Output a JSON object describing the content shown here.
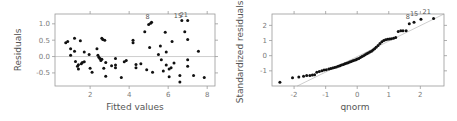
{
  "chart_data": [
    {
      "type": "scatter",
      "title": "",
      "xlabel": "Fitted values",
      "ylabel": "Residuals",
      "xlim": [
        0.2,
        8.4
      ],
      "ylim": [
        -0.9,
        1.3
      ],
      "xticks": [
        2,
        4,
        6,
        8
      ],
      "yticks": [
        -0.5,
        0.0,
        0.5,
        1.0
      ],
      "xtick_labels": [
        "2",
        "4",
        "6",
        "8"
      ],
      "ytick_labels": [
        "-0.5",
        "0.0",
        "0.5",
        "1.0"
      ],
      "grid": false,
      "reference_line": {
        "type": "horizontal",
        "y": 0.0
      },
      "annotations": [
        {
          "label": "8",
          "x": 4.95,
          "y": 1.08
        },
        {
          "label": "15",
          "x": 6.5,
          "y": 1.12
        },
        {
          "label": "21",
          "x": 6.8,
          "y": 1.14
        }
      ],
      "points": [
        [
          0.75,
          0.42
        ],
        [
          0.85,
          0.46
        ],
        [
          1.0,
          0.24
        ],
        [
          1.0,
          0.04
        ],
        [
          1.2,
          0.56
        ],
        [
          1.2,
          0.16
        ],
        [
          1.25,
          -0.15
        ],
        [
          1.35,
          -0.3
        ],
        [
          1.4,
          -0.25
        ],
        [
          1.4,
          -0.38
        ],
        [
          1.5,
          0.48
        ],
        [
          1.55,
          -0.22
        ],
        [
          1.6,
          -0.18
        ],
        [
          1.7,
          0.14
        ],
        [
          1.7,
          -0.16
        ],
        [
          1.95,
          0.06
        ],
        [
          2.0,
          -0.36
        ],
        [
          2.1,
          -0.48
        ],
        [
          2.35,
          0.24
        ],
        [
          2.4,
          0.04
        ],
        [
          2.45,
          -0.02
        ],
        [
          2.5,
          -0.06
        ],
        [
          2.55,
          -0.12
        ],
        [
          2.6,
          -0.08
        ],
        [
          2.6,
          0.56
        ],
        [
          2.65,
          0.52
        ],
        [
          2.7,
          -0.36
        ],
        [
          2.75,
          0.5
        ],
        [
          2.8,
          -0.18
        ],
        [
          2.8,
          -0.6
        ],
        [
          3.1,
          -0.28
        ],
        [
          3.3,
          -0.06
        ],
        [
          3.3,
          -0.26
        ],
        [
          3.3,
          -0.34
        ],
        [
          3.6,
          -0.64
        ],
        [
          3.75,
          -0.16
        ],
        [
          3.85,
          -0.12
        ],
        [
          4.2,
          0.5
        ],
        [
          4.2,
          0.42
        ],
        [
          4.35,
          -0.24
        ],
        [
          4.35,
          -0.34
        ],
        [
          4.6,
          -0.22
        ],
        [
          4.8,
          0.76
        ],
        [
          4.9,
          -0.4
        ],
        [
          5.0,
          0.98
        ],
        [
          5.05,
          0.28
        ],
        [
          5.1,
          1.02
        ],
        [
          5.15,
          1.05
        ],
        [
          5.2,
          -0.48
        ],
        [
          5.5,
          0.06
        ],
        [
          5.6,
          0.32
        ],
        [
          5.65,
          -0.1
        ],
        [
          5.75,
          -0.44
        ],
        [
          5.85,
          0.74
        ],
        [
          5.9,
          0.14
        ],
        [
          5.9,
          -0.26
        ],
        [
          6.05,
          -0.62
        ],
        [
          6.05,
          -0.38
        ],
        [
          6.15,
          -0.34
        ],
        [
          6.2,
          0.46
        ],
        [
          6.3,
          -0.2
        ],
        [
          6.6,
          -0.58
        ],
        [
          6.6,
          -0.78
        ],
        [
          6.7,
          1.1
        ],
        [
          6.85,
          0.76
        ],
        [
          7.0,
          1.1
        ],
        [
          7.0,
          0.52
        ],
        [
          7.0,
          -0.1
        ],
        [
          7.0,
          -0.3
        ],
        [
          7.3,
          -0.58
        ],
        [
          7.55,
          0.16
        ],
        [
          7.85,
          -0.64
        ]
      ]
    },
    {
      "type": "scatter",
      "title": "",
      "xlabel": "qnorm",
      "ylabel": "Standardized residuals",
      "xlim": [
        -2.7,
        2.75
      ],
      "ylim": [
        -2.0,
        2.75
      ],
      "xticks": [
        -2,
        -1,
        0,
        1,
        2
      ],
      "yticks": [
        -1,
        0,
        1,
        2
      ],
      "xtick_labels": [
        "-2",
        "-1",
        "0",
        "1",
        "2"
      ],
      "ytick_labels": [
        "-1",
        "0",
        "1",
        "2"
      ],
      "grid": false,
      "reference_line": {
        "type": "qqline",
        "from": [
          -1.9,
          -2.0
        ],
        "to": [
          2.75,
          2.75
        ]
      },
      "annotations": [
        {
          "label": "8",
          "x": 1.6,
          "y": 2.3
        },
        {
          "label": "15",
          "x": 1.8,
          "y": 2.5
        },
        {
          "label": "21",
          "x": 2.2,
          "y": 2.6
        }
      ],
      "points": [
        [
          -2.45,
          -1.75
        ],
        [
          -2.05,
          -1.45
        ],
        [
          -1.85,
          -1.4
        ],
        [
          -1.7,
          -1.35
        ],
        [
          -1.6,
          -1.3
        ],
        [
          -1.5,
          -1.3
        ],
        [
          -1.42,
          -1.28
        ],
        [
          -1.35,
          -1.25
        ],
        [
          -1.28,
          -1.1
        ],
        [
          -1.2,
          -1.05
        ],
        [
          -1.12,
          -1.0
        ],
        [
          -1.05,
          -0.95
        ],
        [
          -0.98,
          -0.92
        ],
        [
          -0.9,
          -0.88
        ],
        [
          -0.84,
          -0.85
        ],
        [
          -0.78,
          -0.82
        ],
        [
          -0.72,
          -0.78
        ],
        [
          -0.66,
          -0.75
        ],
        [
          -0.6,
          -0.7
        ],
        [
          -0.55,
          -0.66
        ],
        [
          -0.5,
          -0.62
        ],
        [
          -0.44,
          -0.58
        ],
        [
          -0.39,
          -0.54
        ],
        [
          -0.34,
          -0.5
        ],
        [
          -0.29,
          -0.46
        ],
        [
          -0.24,
          -0.42
        ],
        [
          -0.19,
          -0.38
        ],
        [
          -0.14,
          -0.34
        ],
        [
          -0.09,
          -0.3
        ],
        [
          -0.04,
          -0.26
        ],
        [
          0.0,
          -0.22
        ],
        [
          0.05,
          -0.18
        ],
        [
          0.1,
          -0.12
        ],
        [
          0.15,
          -0.06
        ],
        [
          0.2,
          0.0
        ],
        [
          0.25,
          0.06
        ],
        [
          0.3,
          0.12
        ],
        [
          0.35,
          0.18
        ],
        [
          0.4,
          0.24
        ],
        [
          0.45,
          0.3
        ],
        [
          0.5,
          0.38
        ],
        [
          0.55,
          0.46
        ],
        [
          0.6,
          0.56
        ],
        [
          0.66,
          0.68
        ],
        [
          0.72,
          0.8
        ],
        [
          0.78,
          0.92
        ],
        [
          0.84,
          1.0
        ],
        [
          0.9,
          1.05
        ],
        [
          0.96,
          1.08
        ],
        [
          1.02,
          1.1
        ],
        [
          1.08,
          1.12
        ],
        [
          1.15,
          1.15
        ],
        [
          1.22,
          1.2
        ],
        [
          1.3,
          1.6
        ],
        [
          1.38,
          1.65
        ],
        [
          1.45,
          1.65
        ],
        [
          1.55,
          1.65
        ],
        [
          1.65,
          2.1
        ],
        [
          1.8,
          2.2
        ],
        [
          2.02,
          2.4
        ],
        [
          2.42,
          2.45
        ]
      ]
    }
  ],
  "plots": {
    "left": {
      "xlabel": "Fitted values",
      "ylabel": "Residuals",
      "xtick_labels": [
        "2",
        "4",
        "6",
        "8"
      ],
      "ytick_labels": [
        "-0.5",
        "0.0",
        "0.5",
        "1.0"
      ],
      "annotations": [
        "8",
        "15",
        "21"
      ]
    },
    "right": {
      "xlabel": "qnorm",
      "ylabel": "Standardized residuals",
      "xtick_labels": [
        "-2",
        "-1",
        "0",
        "1",
        "2"
      ],
      "ytick_labels": [
        "-1",
        "0",
        "1",
        "2"
      ],
      "annotations": [
        "8",
        "15",
        "21"
      ]
    }
  },
  "colors": {
    "points": "#111111",
    "frame": "#9a9a9a",
    "reference_line": "#c8c8c8",
    "tick_label": "#7a7a7a",
    "axis_title": "#555555"
  }
}
